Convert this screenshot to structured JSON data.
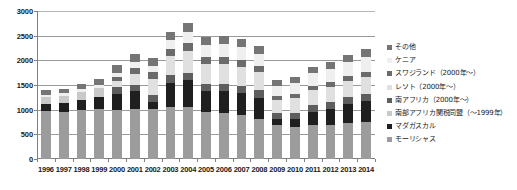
{
  "chart_data": {
    "type": "bar",
    "stacked": true,
    "title": "",
    "xlabel": "",
    "ylabel": "",
    "ylim": [
      0,
      3000
    ],
    "ytick_step": 500,
    "ytick_labels": [
      "0",
      "500",
      "1000",
      "1500",
      "2000",
      "2500",
      "3000"
    ],
    "grid": true,
    "legend_position": "right",
    "categories": [
      "1996",
      "1997",
      "1998",
      "1999",
      "2000",
      "2001",
      "2002",
      "2003",
      "2004",
      "2005",
      "2006",
      "2007",
      "2008",
      "2009",
      "2010",
      "2011",
      "2012",
      "2013",
      "2014"
    ],
    "series": [
      {
        "name": "モーリシャス",
        "color": "#9c9c9c",
        "values": [
          980,
          955,
          990,
          1010,
          1000,
          1010,
          1015,
          1060,
          1060,
          960,
          930,
          900,
          820,
          680,
          640,
          690,
          690,
          720,
          760
        ]
      },
      {
        "name": "マダガスカル",
        "color": "#1f1f1f",
        "values": [
          130,
          175,
          200,
          240,
          320,
          360,
          150,
          490,
          540,
          420,
          440,
          430,
          420,
          130,
          180,
          270,
          330,
          400,
          420
        ]
      },
      {
        "name": "南部アフリカ関税同盟（～1999年）",
        "color": "#c9c9c9",
        "values": [
          150,
          150,
          160,
          180,
          0,
          0,
          0,
          0,
          0,
          0,
          0,
          0,
          0,
          0,
          0,
          0,
          0,
          0,
          0
        ]
      },
      {
        "name": "南アフリカ（2000年～）",
        "color": "#5e5e5e",
        "values": [
          0,
          0,
          0,
          0,
          130,
          140,
          140,
          145,
          150,
          150,
          150,
          150,
          150,
          115,
          120,
          130,
          135,
          140,
          145
        ]
      },
      {
        "name": "レソト（2000年～）",
        "color": "#e0e0e0",
        "values": [
          0,
          0,
          0,
          0,
          130,
          220,
          320,
          390,
          450,
          390,
          400,
          390,
          370,
          280,
          300,
          310,
          310,
          320,
          340
        ]
      },
      {
        "name": "スワジランド（2000年～）",
        "color": "#6b6b6b",
        "values": [
          0,
          0,
          0,
          0,
          80,
          110,
          130,
          140,
          150,
          140,
          140,
          130,
          120,
          75,
          80,
          85,
          90,
          95,
          100
        ]
      },
      {
        "name": "ケニア",
        "color": "#efefef",
        "values": [
          40,
          50,
          60,
          70,
          90,
          120,
          140,
          180,
          220,
          250,
          270,
          270,
          250,
          200,
          220,
          250,
          270,
          290,
          310
        ]
      },
      {
        "name": "その他",
        "color": "#757575",
        "values": [
          90,
          100,
          110,
          120,
          150,
          160,
          160,
          170,
          180,
          170,
          170,
          170,
          160,
          120,
          130,
          140,
          145,
          150,
          155
        ]
      }
    ],
    "totals": [
      1390,
      1430,
      1520,
      1620,
      1900,
      2120,
      2055,
      2575,
      2750,
      2480,
      2500,
      2440,
      2290,
      1600,
      1670,
      1875,
      1970,
      2115,
      2230
    ]
  },
  "legend": {
    "items": [
      {
        "label": "その他",
        "color": "#757575"
      },
      {
        "label": "ケニア",
        "color": "#efefef"
      },
      {
        "label": "スワジランド（2000年～）",
        "color": "#6b6b6b"
      },
      {
        "label": "レソト（2000年～）",
        "color": "#e0e0e0"
      },
      {
        "label": "南アフリカ（2000年～）",
        "color": "#5e5e5e"
      },
      {
        "label": "南部アフリカ関税同盟（～1999年）",
        "color": "#c9c9c9"
      },
      {
        "label": "マダガスカル",
        "color": "#1f1f1f"
      },
      {
        "label": "モーリシャス",
        "color": "#9c9c9c"
      }
    ]
  }
}
